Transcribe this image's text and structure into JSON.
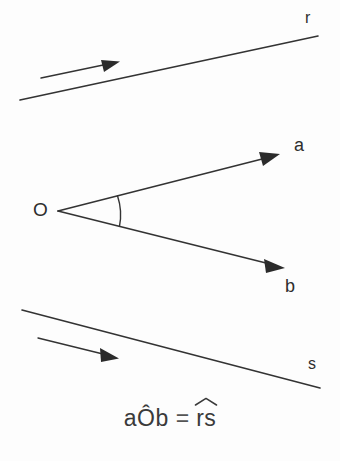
{
  "figure": {
    "background_color": "#fdfdfd",
    "stroke_color": "#333333",
    "text_color": "#2e2e2e"
  },
  "labels": {
    "line_r": "r",
    "ray_a": "a",
    "vertex_O": "O",
    "ray_b": "b",
    "line_s": "s"
  },
  "formula": {
    "left_term": "aÔb",
    "equals": "=",
    "right_term": "rs",
    "full_text": "aÔb = r̂s"
  },
  "geometry": {
    "line_r": {
      "x1": 20,
      "y1": 100,
      "x2": 318,
      "y2": 36
    },
    "arrow_r": {
      "x1": 41,
      "y1": 78,
      "x2": 118,
      "y2": 62
    },
    "ray_a": {
      "x1": 58,
      "y1": 211,
      "x2": 278,
      "y2": 155
    },
    "ray_b": {
      "x1": 58,
      "y1": 211,
      "x2": 283,
      "y2": 267
    },
    "angle_arc": {
      "cx": 58,
      "cy": 211,
      "radius": 62
    },
    "line_s": {
      "x1": 22,
      "y1": 310,
      "x2": 320,
      "y2": 388
    },
    "arrow_s": {
      "x1": 38,
      "y1": 338,
      "x2": 118,
      "y2": 358
    }
  }
}
